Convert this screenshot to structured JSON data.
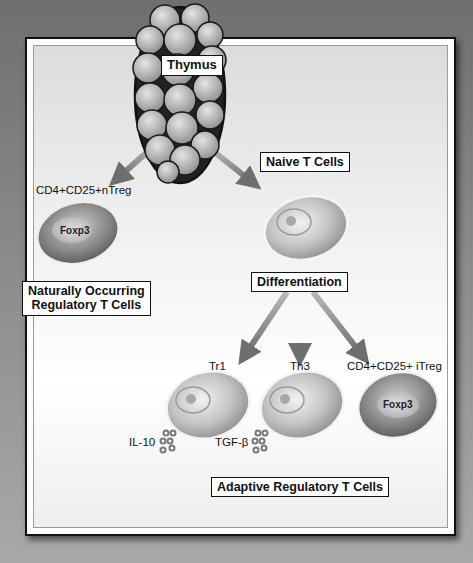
{
  "diagram": {
    "thymus_label": "Thymus",
    "naive_label": "Naive T Cells",
    "differentiation_label": "Differentiation",
    "natural_group_label_line1": "Naturally Occurring",
    "natural_group_label_line2": "Regulatory T Cells",
    "adaptive_group_label": "Adaptive Regulatory T Cells",
    "ntreg_label": "CD4+CD25+nTreg",
    "ntreg_marker": "Foxp3",
    "tr1_label": "Tr1",
    "th3_label": "Th3",
    "itreg_label": "CD4+CD25+ iTreg",
    "itreg_marker": "Foxp3",
    "tr1_cytokine": "IL-10",
    "th3_cytokine": "TGF-β"
  },
  "colors": {
    "background": "#8a8a8a",
    "frame_border": "#111111",
    "arrow": "#7d7d7d",
    "cell_fill": "#bdbdbd",
    "treg_cell_fill": "#8f8f8f"
  }
}
